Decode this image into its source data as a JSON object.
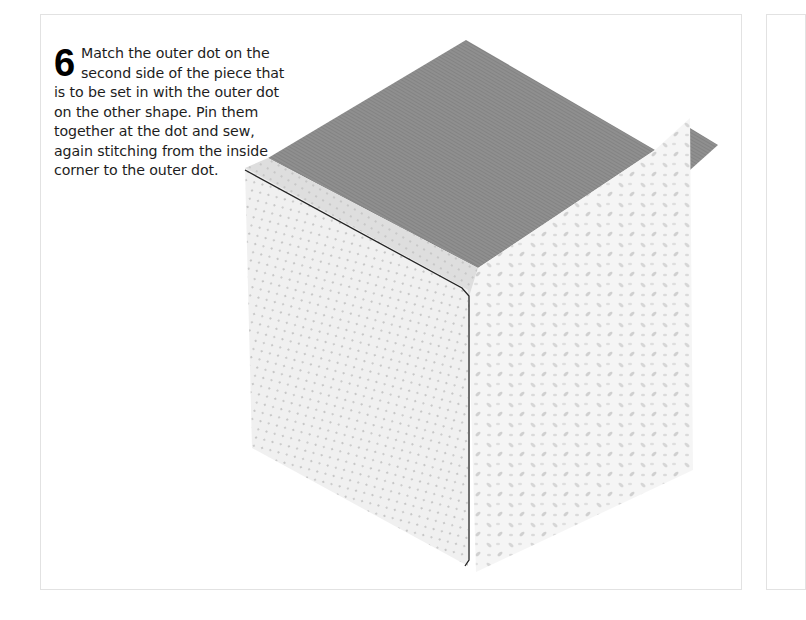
{
  "page": {
    "step": {
      "number": "6",
      "text": "Match the outer dot on the second side of the piece that is to be set in with the outer dot on the other shape. Pin them together at the dot and sew, again stitching from the inside corner to the outer dot."
    },
    "illustration": {
      "subject": "pieced fabric cube (tumbling block) with set-in seam",
      "colors": {
        "top_face": "#8e8e8e",
        "top_face_dark": "#7a7a7a",
        "left_face": "#efefef",
        "left_face_dots": "#b8b8b8",
        "right_face": "#f3f3f3",
        "right_face_pattern": "#cfcfcf",
        "seam_allowance_strip": "#dcdcdc",
        "stitching_line": "#222222",
        "panel_border": "#e2e2e2"
      }
    }
  }
}
